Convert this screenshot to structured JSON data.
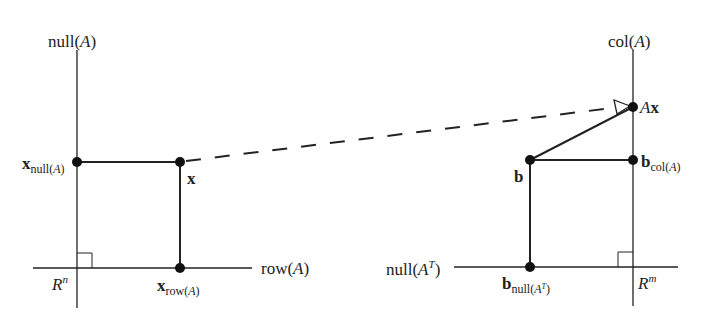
{
  "diagram": {
    "colors": {
      "ink": "#222222",
      "background": "#ffffff"
    },
    "left": {
      "space": {
        "base": "R",
        "exp": "n"
      },
      "vertical_axis_label": {
        "pre": "null(",
        "var": "A",
        "post": ")"
      },
      "horizontal_axis_label": {
        "pre": "row(",
        "var": "A",
        "post": ")"
      },
      "points": {
        "x_null": {
          "main": "x",
          "sub_pre": "null(",
          "sub_var": "A",
          "sub_post": ")"
        },
        "x": {
          "main": "x"
        },
        "x_row": {
          "main": "x",
          "sub_pre": "row(",
          "sub_var": "A",
          "sub_post": ")"
        }
      }
    },
    "right": {
      "space": {
        "base": "R",
        "exp": "m"
      },
      "vertical_axis_label": {
        "pre": "col(",
        "var": "A",
        "post": ")"
      },
      "horizontal_axis_label": {
        "pre": "null(",
        "var": "A",
        "sup": "T",
        "post": ")"
      },
      "points": {
        "Ax": {
          "var": "A",
          "main": "x"
        },
        "b": {
          "main": "b"
        },
        "b_col": {
          "main": "b",
          "sub_pre": "col(",
          "sub_var": "A",
          "sub_post": ")"
        },
        "b_null": {
          "main": "b",
          "sub_pre": "null(",
          "sub_var": "A",
          "sub_sup": "T",
          "sub_post": ")"
        }
      }
    },
    "mapping_arrow": {
      "from": "x",
      "to": "Ax",
      "style": "dashed"
    }
  }
}
